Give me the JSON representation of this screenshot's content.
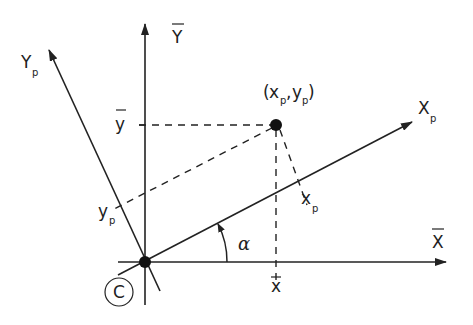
{
  "diagram": {
    "type": "coordinate-rotation",
    "origin_label": "C",
    "axes": {
      "global_x": {
        "label": "X",
        "overbar": true
      },
      "global_y": {
        "label": "Y",
        "overbar": true
      },
      "principal_x": {
        "label": "X",
        "subscript": "p"
      },
      "principal_y": {
        "label": "Y",
        "subscript": "p"
      }
    },
    "point": {
      "label_open": "(",
      "label_x": "x",
      "label_x_sub": "p",
      "label_comma": ",",
      "label_y": "y",
      "label_y_sub": "p",
      "label_close": ")"
    },
    "projections": {
      "y_bar": {
        "label": "y",
        "overbar": true
      },
      "x_bar": {
        "label": "x",
        "overbar": true
      },
      "x_p": {
        "label": "x",
        "subscript": "p"
      },
      "y_p": {
        "label": "y",
        "subscript": "p"
      }
    },
    "angle": {
      "label": "α"
    },
    "colors": {
      "stroke": "#222222",
      "background": "#ffffff"
    }
  }
}
